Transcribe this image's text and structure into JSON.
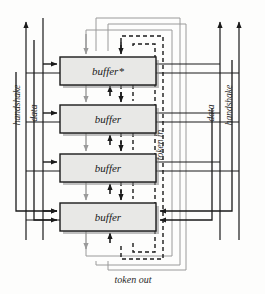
{
  "diagram": {
    "colors": {
      "black": "#1a1a1a",
      "gray": "#9a9a9a",
      "box_fill": "#e8e8e6",
      "box_stroke": "#1a1a1a",
      "shadow": "#8c8c8c",
      "background": "#fdfdfc"
    },
    "blocks": [
      {
        "id": "buffer-star",
        "label": "buffer*",
        "x": 60,
        "y": 57,
        "w": 96,
        "h": 28
      },
      {
        "id": "buffer-2",
        "label": "buffer",
        "x": 60,
        "y": 105,
        "w": 96,
        "h": 28
      },
      {
        "id": "buffer-3",
        "label": "buffer",
        "x": 60,
        "y": 154,
        "w": 96,
        "h": 28
      },
      {
        "id": "buffer-4",
        "label": "buffer",
        "x": 60,
        "y": 203,
        "w": 96,
        "h": 28
      }
    ],
    "labels": {
      "handshake_left": "handshake",
      "data_left": "data",
      "data_right": "data",
      "handshake_right": "handshake",
      "token_in": "token in",
      "token_out": "token out"
    }
  }
}
